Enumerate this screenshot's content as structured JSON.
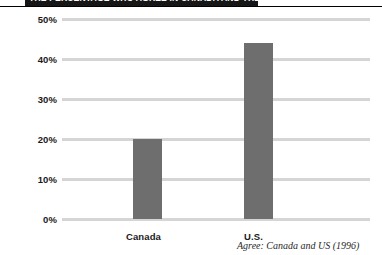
{
  "header": {
    "title": "THE PERCENTAGE WHO AGREE IN CANADA AND THE U.S.",
    "bar_color": "#161616"
  },
  "chart_data": {
    "type": "bar",
    "title": "",
    "subtitle": "",
    "xlabel": "",
    "ylabel": "",
    "categories": [
      "Canada",
      "U.S."
    ],
    "values": [
      20,
      44
    ],
    "value_labels": [
      "20%",
      "44%"
    ],
    "ylim": [
      0,
      50
    ],
    "yticks": [
      0,
      10,
      20,
      30,
      40,
      50
    ],
    "ytick_labels": [
      "0%",
      "10%",
      "20%",
      "30%",
      "40%",
      "50%"
    ],
    "grid": true,
    "legend": "none",
    "bar_color": "#6e6e6e",
    "gridline_color": "#d5d5d5",
    "annotation": "Agree: Canada and US (1996)"
  },
  "axis": {
    "tick_0": "0%",
    "tick_10": "10%",
    "tick_20": "20%",
    "tick_30": "30%",
    "tick_40": "40%",
    "tick_50": "50%"
  },
  "categories": {
    "cat_0": "Canada",
    "cat_1": "U.S."
  },
  "footnote": {
    "text": "Agree: Canada and US (1996)"
  }
}
